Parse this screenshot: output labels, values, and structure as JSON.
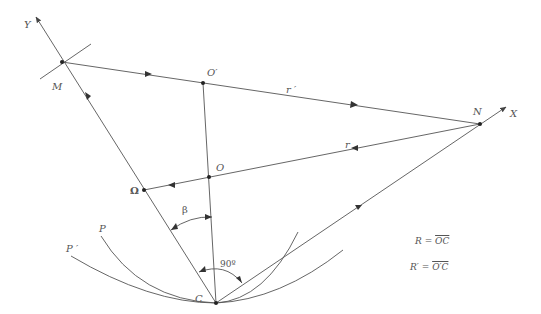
{
  "diagram": {
    "title": "",
    "colors": {
      "line": "#555555",
      "text": "#555555",
      "background": "#ffffff"
    },
    "points": {
      "M": {
        "label": "M",
        "x": 62,
        "y": 62
      },
      "O_prime": {
        "label": "O′",
        "x": 203,
        "y": 83
      },
      "O": {
        "label": "O",
        "x": 209,
        "y": 177
      },
      "N": {
        "label": "N",
        "x": 480,
        "y": 124
      },
      "Omega": {
        "label": "Ω",
        "x": 144,
        "y": 190
      },
      "C": {
        "label": "C",
        "x": 216,
        "y": 303
      }
    },
    "axes": {
      "Y": {
        "label": "Y",
        "from": "C",
        "to": [
          35,
          15
        ]
      },
      "X": {
        "label": "X",
        "from": "C",
        "to": [
          507,
          106
        ]
      }
    },
    "segments": [
      {
        "name": "r_prime",
        "label": "r ′",
        "from": "M",
        "to": "N",
        "direction": "M→N"
      },
      {
        "name": "r",
        "label": "r",
        "from": "N",
        "to": "Omega",
        "direction": "N→Ω"
      },
      {
        "name": "O_prime_C",
        "from": "O_prime",
        "to": "C"
      }
    ],
    "curves": [
      {
        "label": "P",
        "note": "curve through C tangent to CY-side"
      },
      {
        "label": "P ′",
        "note": "outer curve through C"
      }
    ],
    "angles": [
      {
        "label": "β",
        "between": [
          "CΩ",
          "CO"
        ]
      },
      {
        "label": "90º",
        "between": [
          "CY",
          "CX"
        ]
      }
    ],
    "labels": {
      "Y": "Y",
      "X": "X",
      "M": "M",
      "O_prime": "O′",
      "N": "N",
      "O": "O",
      "Omega": "Ω",
      "C": "C",
      "P": "P",
      "P_prime": "P ′",
      "r": "r",
      "r_prime": "r ′",
      "beta": "β",
      "right_angle": "90º"
    },
    "legend": {
      "R": {
        "lhs": "R",
        "eq": "=",
        "rhs": "OC"
      },
      "R_prime": {
        "lhs": "R′",
        "eq": "=",
        "rhs": "O′C"
      }
    }
  }
}
